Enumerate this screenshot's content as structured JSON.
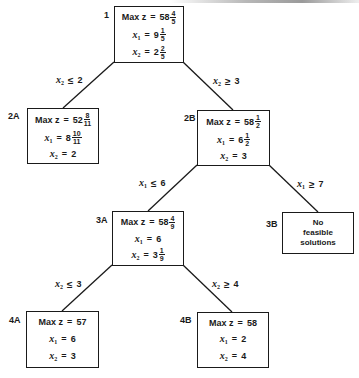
{
  "diagram": {
    "type": "branch-and-bound-tree",
    "line_color": "#1a1a1a",
    "nodes": [
      {
        "id": "1",
        "objective_label": "Max z",
        "objective_whole": "58",
        "objective_num": "4",
        "objective_den": "5",
        "x1_label": "x",
        "x1_sub": "1",
        "x1_whole": "9",
        "x1_num": "1",
        "x1_den": "5",
        "x2_label": "x",
        "x2_sub": "2",
        "x2_whole": "2",
        "x2_num": "2",
        "x2_den": "5"
      },
      {
        "id": "2A",
        "objective_label": "Max z",
        "objective_whole": "52",
        "objective_num": "8",
        "objective_den": "11",
        "x1_label": "x",
        "x1_sub": "1",
        "x1_whole": "8",
        "x1_num": "10",
        "x1_den": "11",
        "x2_label": "x",
        "x2_sub": "2",
        "x2_whole": "2"
      },
      {
        "id": "2B",
        "objective_label": "Max z",
        "objective_whole": "58",
        "objective_num": "1",
        "objective_den": "2",
        "x1_label": "x",
        "x1_sub": "1",
        "x1_whole": "6",
        "x1_num": "1",
        "x1_den": "2",
        "x2_label": "x",
        "x2_sub": "2",
        "x2_whole": "3"
      },
      {
        "id": "3A",
        "objective_label": "Max z",
        "objective_whole": "58",
        "objective_num": "4",
        "objective_den": "9",
        "x1_label": "x",
        "x1_sub": "1",
        "x1_whole": "6",
        "x2_label": "x",
        "x2_sub": "2",
        "x2_whole": "3",
        "x2_num": "1",
        "x2_den": "9"
      },
      {
        "id": "3B",
        "message_line1": "No",
        "message_line2": "feasible",
        "message_line3": "solutions"
      },
      {
        "id": "4A",
        "objective_label": "Max z",
        "objective_whole": "57",
        "x1_label": "x",
        "x1_sub": "1",
        "x1_whole": "6",
        "x2_label": "x",
        "x2_sub": "2",
        "x2_whole": "3"
      },
      {
        "id": "4B",
        "objective_label": "Max z",
        "objective_whole": "58",
        "x1_label": "x",
        "x1_sub": "1",
        "x1_whole": "2",
        "x2_label": "x",
        "x2_sub": "2",
        "x2_whole": "4"
      }
    ],
    "edges": [
      {
        "from": "1",
        "to": "2A",
        "var": "x",
        "sub": "2",
        "op": "≤",
        "value": "2"
      },
      {
        "from": "1",
        "to": "2B",
        "var": "x",
        "sub": "2",
        "op": "≥",
        "value": "3"
      },
      {
        "from": "2B",
        "to": "3A",
        "var": "x",
        "sub": "1",
        "op": "≤",
        "value": "6"
      },
      {
        "from": "2B",
        "to": "3B",
        "var": "x",
        "sub": "1",
        "op": "≥",
        "value": "7"
      },
      {
        "from": "3A",
        "to": "4A",
        "var": "x",
        "sub": "2",
        "op": "≤",
        "value": "3"
      },
      {
        "from": "3A",
        "to": "4B",
        "var": "x",
        "sub": "2",
        "op": "≥",
        "value": "4"
      }
    ],
    "equals_sign": "="
  }
}
